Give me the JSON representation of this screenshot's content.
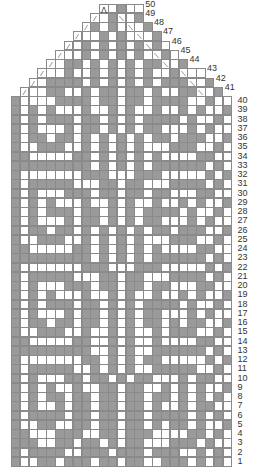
{
  "chart_title": "",
  "grid": {
    "columns": 25,
    "rows": 50,
    "cell_w": 8.82,
    "cell_h": 9.25,
    "origin_x": 11,
    "bottom_y": 466,
    "colors": {
      "light": "#ffffff",
      "dark": "#9a9a9a",
      "line": "#8a8a8a"
    }
  },
  "legend_symbols": {
    "G": "dark-stitch",
    "W": "light-stitch",
    "L": "left-decrease",
    "R": "right-decrease",
    "A": "center-double-decrease"
  },
  "row_labels": [
    "1",
    "2",
    "3",
    "4",
    "5",
    "6",
    "7",
    "8",
    "9",
    "10",
    "11",
    "12",
    "13",
    "14",
    "15",
    "16",
    "17",
    "18",
    "19",
    "20",
    "21",
    "22",
    "23",
    "24",
    "25",
    "26",
    "27",
    "28",
    "29",
    "30",
    "31",
    "32",
    "33",
    "34",
    "35",
    "36",
    "37",
    "38",
    "39",
    "40",
    "41",
    "42",
    "43",
    "44",
    "45",
    "46",
    "47",
    "48",
    "49",
    "50"
  ],
  "rows": [
    {
      "n": 1,
      "start": 1,
      "cells": "GWWGGWGGGWGGWGGWWGGGWGWGW"
    },
    {
      "n": 2,
      "start": 1,
      "cells": "GWGGGGWWGGGWGGGWGGGWWGWGW"
    },
    {
      "n": 3,
      "start": 1,
      "cells": "GGGWWGGWGGWGWGGWWWGGGWGWW"
    },
    {
      "n": 4,
      "start": 1,
      "cells": "GGWWWGGGWWGGWGGGWWWWGGWGW"
    },
    {
      "n": 5,
      "start": 1,
      "cells": "GWWGGWWGGWGGWGGWGWGGWGWWG"
    },
    {
      "n": 6,
      "start": 1,
      "cells": "GWGGGGWGGWGGWGGWGGGGWGWGW"
    },
    {
      "n": 7,
      "start": 1,
      "cells": "GWGWWGWGGWGGWGGWGWWGWGGWW"
    },
    {
      "n": 8,
      "start": 1,
      "cells": "GWGWGGWGGWGGWGGWGGWGWGWGW"
    },
    {
      "n": 9,
      "start": 1,
      "cells": "GWGWGWWGWWGGWGGWWGWGWGWWG"
    },
    {
      "n": 10,
      "start": 1,
      "cells": "GWGWWWGGWGGWGWGGWWWGWGGWW"
    },
    {
      "n": 11,
      "start": 1,
      "cells": "GWGGGGGWWGWGWGWWGGGGGWWGW"
    },
    {
      "n": 12,
      "start": 1,
      "cells": "GWWWWWWWGGWGWGWGGWWWWWGWG"
    },
    {
      "n": 13,
      "start": 1,
      "cells": "GGGGGGGGGWWGWGWWGGGGGGWGW"
    },
    {
      "n": 14,
      "start": 1,
      "cells": "GGWWWWWGGWWGWGWWGWWWWGGWW"
    },
    {
      "n": 15,
      "start": 1,
      "cells": "GWWGGGWWGWWGWGWWGWGGGWWGW"
    },
    {
      "n": 16,
      "start": 1,
      "cells": "GWGGWGGWGGWGWGWGGWGWGGWWG"
    },
    {
      "n": 17,
      "start": 1,
      "cells": "GWGWWWGWGGWGWGWGGWWWGWGWW"
    },
    {
      "n": 18,
      "start": 1,
      "cells": "GWGWGGGWGGWGWGWGGGGWGWWGW"
    },
    {
      "n": 19,
      "start": 1,
      "cells": "GWGWGWWWGWWGWGWWGWWGWGWWG"
    },
    {
      "n": 20,
      "start": 1,
      "cells": "GWGWWWGGGWGGWGGWGGWWWGGWW"
    },
    {
      "n": 21,
      "start": 1,
      "cells": "GWGGGGGWWWGGWGGWWWGGGGWGW"
    },
    {
      "n": 22,
      "start": 1,
      "cells": "GWWWWWWWGGGWWWGGGWWWWWGWG"
    },
    {
      "n": 23,
      "start": 1,
      "cells": "GGGGGGGGGWGWGWGWGGGGGGWGW"
    },
    {
      "n": 24,
      "start": 1,
      "cells": "GGWWWWWGGWGWGWGWGWWWWGGWW"
    },
    {
      "n": 25,
      "start": 1,
      "cells": "GWWGGGWWGWGWGWGWWWGGGWWGW"
    },
    {
      "n": 26,
      "start": 1,
      "cells": "GWGGWGGWGWGWGWGWGGWGGGWWG"
    },
    {
      "n": 27,
      "start": 1,
      "cells": "GWGWWWGWGGWGWGWGGWWWGWGWW"
    },
    {
      "n": 28,
      "start": 1,
      "cells": "GWGWGGGWGGWGWGWGGGGWGWWGW"
    },
    {
      "n": 29,
      "start": 1,
      "cells": "GWGWGWWWGWWGWGWWGWWGWGWWG"
    },
    {
      "n": 30,
      "start": 1,
      "cells": "GWGWWWGGGWGGWGGWGGWWWGGWW"
    },
    {
      "n": 31,
      "start": 1,
      "cells": "GWGGGGGWWWGGWGGWWWGGGGWGW"
    },
    {
      "n": 32,
      "start": 1,
      "cells": "GWWWWWWWGGGWWWGGGWWWWWGWG"
    },
    {
      "n": 33,
      "start": 1,
      "cells": "GGGGGGGGGWGWGWGWGGGGGGWGW"
    },
    {
      "n": 34,
      "start": 1,
      "cells": "GGWWWWWGGWGWGWGWGWWWWGGWW"
    },
    {
      "n": 35,
      "start": 1,
      "cells": "GWWGGGWWGWGWGWGWWWGGGWWGW"
    },
    {
      "n": 36,
      "start": 1,
      "cells": "GWGGWGGWGWGWGWGWGGWGGGWWG"
    },
    {
      "n": 37,
      "start": 1,
      "cells": "GWGWWWGWGGWGWGWGGWWWGWGWW"
    },
    {
      "n": 38,
      "start": 1,
      "cells": "GWGWGGGWGGWGWGWGGGGWGWWGW"
    },
    {
      "n": 39,
      "start": 1,
      "cells": "GWGWGWWWGWWGWGWWGWWGWGWWG"
    },
    {
      "n": 40,
      "start": 1,
      "cells": "GWWWWGGGGWGGWGGWGGGGWWGWW"
    },
    {
      "n": 41,
      "start": 2,
      "cells": "LWWGGWWGWGGWGGWGWWGGRWG"
    },
    {
      "n": 42,
      "start": 3,
      "cells": "LWGGGGWGWGWGWGWGGGRWG"
    },
    {
      "n": 43,
      "start": 4,
      "cells": "LWWGWWGWGWGWGWWGRWW"
    },
    {
      "n": 44,
      "start": 5,
      "cells": "LWGGWGWGWGWGGRWG"
    },
    {
      "n": 45,
      "start": 6,
      "cells": "LWWGWGWGWGWRGW"
    },
    {
      "n": 46,
      "start": 7,
      "cells": "LWGWGWGWGRGW"
    },
    {
      "n": 47,
      "start": 8,
      "cells": "LWWGWGWRWG"
    },
    {
      "n": 48,
      "start": 9,
      "cells": "LGWGWRWG"
    },
    {
      "n": 49,
      "start": 10,
      "cells": "LWGRWG"
    },
    {
      "n": 50,
      "start": 11,
      "cells": "AWGWW"
    }
  ],
  "symbols_text": {
    "L": "⁄",
    "R": "⟍",
    "A": "⋀"
  }
}
